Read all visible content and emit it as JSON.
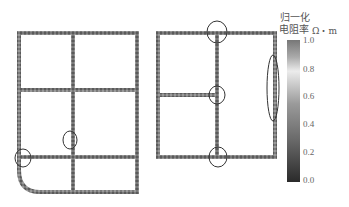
{
  "legend": {
    "title_line1": "归一化",
    "title_line2": "电阻率",
    "unit": "Ω・m",
    "ticks": [
      "1.0",
      "0.8",
      "0.6",
      "0.4",
      "0.2",
      "0.0"
    ],
    "colors": {
      "top": "#6e6e6e",
      "light": "#eaeaea",
      "bottom": "#2a2a2a"
    }
  },
  "left_grid": {
    "name": "grid-a",
    "marked_regions": 2
  },
  "right_grid": {
    "name": "grid-b",
    "marked_regions": 4
  }
}
